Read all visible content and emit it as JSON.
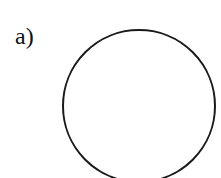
{
  "figure": {
    "label": "a)",
    "shape": "circle",
    "stroke_color": "#1a1a1a",
    "fill_color": "none",
    "background": "#ffffff"
  }
}
